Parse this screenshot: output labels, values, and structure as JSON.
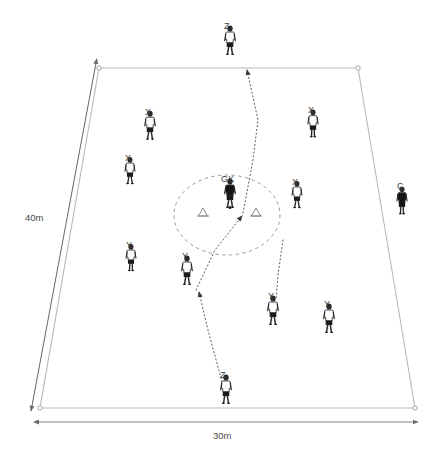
{
  "diagram": {
    "type": "sports-drill-diagram",
    "background_color": "#ffffff",
    "field": {
      "name": "training-grid",
      "shape": "trapezoid",
      "stroke_color": "#b9b9b9",
      "corners": [
        {
          "label": "top-left",
          "x": 99,
          "y": 68
        },
        {
          "label": "top-right",
          "x": 358,
          "y": 68
        },
        {
          "label": "bottom-right",
          "x": 415,
          "y": 408
        },
        {
          "label": "bottom-left",
          "x": 40,
          "y": 408
        }
      ]
    },
    "dimensions": [
      {
        "name": "height-dimension",
        "label": "40m",
        "label_x": 25,
        "label_y": 212,
        "x1": 96,
        "y1": 63,
        "x2": 31,
        "y2": 411,
        "stroke_color": "#555555"
      },
      {
        "name": "width-dimension",
        "label": "30m",
        "label_x": 213,
        "label_y": 430,
        "x1": 38,
        "y1": 422,
        "x2": 418,
        "y2": 422,
        "stroke_color": "#777777"
      }
    ],
    "center_zone": {
      "name": "goalkeeper-zone",
      "shape": "ellipse",
      "cx": 227,
      "cy": 215,
      "rx": 53,
      "ry": 40,
      "stroke_color": "#9a9a9a",
      "dashed": true
    },
    "cones": [
      {
        "name": "cone-left",
        "x": 203,
        "y": 212,
        "color": "#8c8c8c"
      },
      {
        "name": "cone-right",
        "x": 256,
        "y": 212,
        "color": "#8c8c8c"
      }
    ],
    "players": [
      {
        "id": "z-top",
        "label": "Z",
        "role": "server",
        "x": 230,
        "y": 45,
        "kit": "white",
        "scale": 1.0,
        "label_dx": -2,
        "label_dy": -24,
        "stance": "front",
        "ball": false
      },
      {
        "id": "x-1",
        "label": "X",
        "role": "attacker",
        "x": 150,
        "y": 130,
        "kit": "white",
        "scale": 0.98,
        "label_dx": -1,
        "label_dy": -23,
        "stance": "front",
        "ball": false
      },
      {
        "id": "x-2",
        "label": "X",
        "role": "attacker",
        "x": 130,
        "y": 175,
        "kit": "white",
        "scale": 0.92,
        "label_dx": -1,
        "label_dy": -22,
        "stance": "front",
        "ball": false
      },
      {
        "id": "x-3",
        "label": "X",
        "role": "attacker",
        "x": 313,
        "y": 128,
        "kit": "white",
        "scale": 0.95,
        "label_dx": -1,
        "label_dy": -23,
        "stance": "side",
        "ball": false
      },
      {
        "id": "x-4",
        "label": "X",
        "role": "attacker",
        "x": 297,
        "y": 199,
        "kit": "white",
        "scale": 0.92,
        "label_dx": -1,
        "label_dy": -22,
        "stance": "front",
        "ball": false
      },
      {
        "id": "gk",
        "label": "GK",
        "role": "goalkeeper",
        "x": 230,
        "y": 198,
        "kit": "black",
        "scale": 1.0,
        "label_dx": -5,
        "label_dy": -24,
        "stance": "back",
        "ball": true
      },
      {
        "id": "y-1",
        "label": "Y",
        "role": "defender",
        "x": 131,
        "y": 262,
        "kit": "white",
        "scale": 0.92,
        "label_dx": -1,
        "label_dy": -22,
        "stance": "side",
        "ball": false
      },
      {
        "id": "y-2",
        "label": "Y",
        "role": "defender",
        "x": 187,
        "y": 275,
        "kit": "white",
        "scale": 1.0,
        "label_dx": -1,
        "label_dy": -24,
        "stance": "back",
        "ball": false
      },
      {
        "id": "y-3",
        "label": "Y",
        "role": "defender",
        "x": 273,
        "y": 315,
        "kit": "white",
        "scale": 1.0,
        "label_dx": -1,
        "label_dy": -24,
        "stance": "front",
        "ball": false
      },
      {
        "id": "y-4",
        "label": "Y",
        "role": "defender",
        "x": 329,
        "y": 323,
        "kit": "white",
        "scale": 1.0,
        "label_dx": -1,
        "label_dy": -24,
        "stance": "front",
        "ball": false
      },
      {
        "id": "z-bottom",
        "label": "Z",
        "role": "server",
        "x": 226,
        "y": 394,
        "kit": "white",
        "scale": 1.0,
        "label_dx": -2,
        "label_dy": -24,
        "stance": "front",
        "ball": false
      },
      {
        "id": "coach",
        "label": "C",
        "role": "coach",
        "x": 402,
        "y": 205,
        "kit": "allblack",
        "scale": 0.95,
        "label_dx": -1,
        "label_dy": -24,
        "stance": "side",
        "ball": false
      }
    ],
    "movement_paths": [
      {
        "name": "path-gk-to-z-top",
        "from": "gk-zone",
        "to": "z-top",
        "points": "243,213 253,160 258,120 247,70",
        "arrow_at": "end",
        "style": "dotted"
      },
      {
        "name": "path-y2-to-gk-zone",
        "from": "y-2",
        "to": "gk-zone",
        "points": "196,290 215,250 242,216",
        "arrow_at": "end",
        "style": "dotted"
      },
      {
        "name": "path-x4-down",
        "from": "x-4",
        "to": "y-3",
        "points": "283,240 278,275 276,300",
        "arrow_at": "none",
        "style": "dotted"
      },
      {
        "name": "path-z-bottom-to-y2",
        "from": "z-bottom",
        "to": "y-2",
        "points": "222,382 208,330 199,292",
        "arrow_at": "end",
        "style": "dotted"
      }
    ],
    "legend_keys": {
      "X": "attacking team player",
      "Y": "defending team player",
      "Z": "server / feeder",
      "GK": "goalkeeper",
      "C": "coach"
    }
  }
}
